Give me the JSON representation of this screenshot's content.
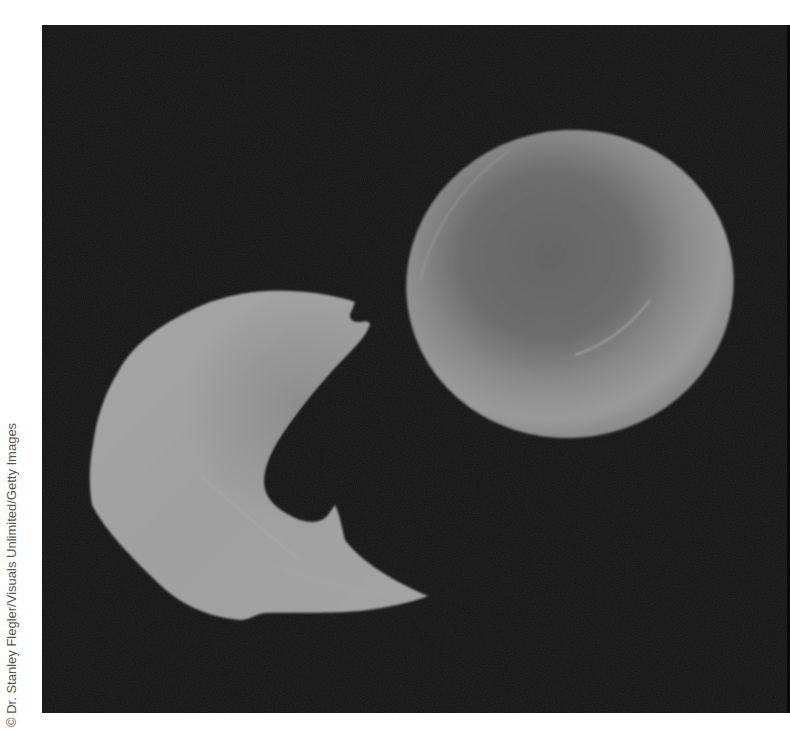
{
  "image": {
    "subject": "Scanning electron micrograph of a sickle-shaped red blood cell next to a normal round red blood cell",
    "credit": "© Dr. Stanley Flegler/Visuals Unlimited/Getty Images",
    "elements": [
      {
        "name": "sickle-cell",
        "description": "crescent / sickle-shaped red blood cell, lower left"
      },
      {
        "name": "normal-red-blood-cell",
        "description": "round biconcave disc red blood cell, upper right"
      }
    ],
    "colors": {
      "background": "#121212",
      "sickle_cell": "#a2a2a2",
      "normal_cell_rim": "#9a9a9a",
      "normal_cell_center": "#6c6c6c",
      "page": "#ffffff"
    }
  }
}
